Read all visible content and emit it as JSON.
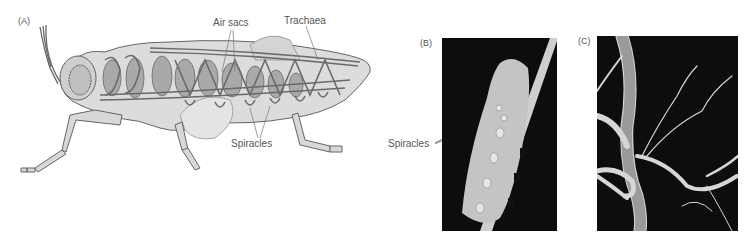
{
  "figure": {
    "panels": [
      {
        "id": "A",
        "label": "(A)",
        "type": "illustration",
        "subject": "insect tracheal system (grasshopper cutaway)",
        "callouts": [
          "Air sacs",
          "Trachaea",
          "Spiracles"
        ]
      },
      {
        "id": "B",
        "label": "(B)",
        "type": "photograph",
        "subject": "caterpillar on stem showing spiracles",
        "callouts": [
          "Spiracles"
        ]
      },
      {
        "id": "C",
        "label": "(C)",
        "type": "photograph",
        "subject": "tracheae micrograph",
        "callouts": []
      }
    ],
    "colors": {
      "background": "#ffffff",
      "body_fill": "#d8d8d8",
      "sac_fill": "#a9a9a9",
      "trachea_stroke": "#6a6a6a",
      "outline": "#555555",
      "photo_bg": "#0d0d0d",
      "label_text": "#555555"
    }
  }
}
